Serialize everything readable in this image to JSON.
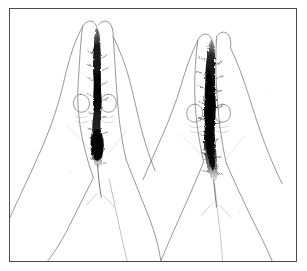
{
  "figure": {
    "type": "line-drawing",
    "background_color": "#ffffff",
    "frame_color": "#4a4a4a",
    "ink_color": "#6e6e6e",
    "shade_color": "#141414",
    "frame": {
      "x": 9,
      "y": 8,
      "width": 288,
      "height": 254,
      "border_width": 1.6
    },
    "panels": [
      {
        "id": "left-pair",
        "label": "left finger pair",
        "center_x": 88,
        "tip_y": 22,
        "shade_density": "moderate",
        "shade_note": "narrow dark band between the two fingers, widening into a dense lens shape near the proximal interphalangeal level",
        "nails": 2
      },
      {
        "id": "right-pair",
        "label": "right finger pair",
        "center_x": 205,
        "tip_y": 30,
        "shade_density": "heavy",
        "shade_note": "broad dense dark band offset toward the left finger, running the full length of the apposed fingers",
        "nails": 2
      }
    ],
    "ink_opacity": 0.85
  },
  "accessibility": {
    "alt_text": "Line drawing of two hands, each with index and middle fingers held together and extended, dark shading shown along the apposed finger surfaces."
  }
}
